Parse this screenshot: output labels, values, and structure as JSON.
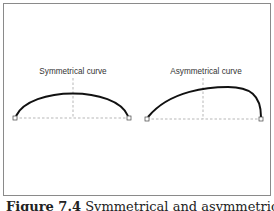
{
  "figure": {
    "caption_number": "Figure 7.4",
    "caption_text": "Symmetrical and asymmetrical curves",
    "panels": [
      {
        "label": "Symmetrical curve",
        "type": "symmetrical",
        "anchor_left": [
          15,
          118
        ],
        "anchor_right": [
          129,
          118
        ],
        "midline_x": 73,
        "peak": [
          73,
          89
        ]
      },
      {
        "label": "Asymmetrical curve",
        "type": "asymmetrical",
        "anchor_left": [
          147,
          119
        ],
        "anchor_right": [
          261,
          119
        ],
        "midline_x": 203,
        "peak": [
          228,
          87
        ]
      }
    ]
  },
  "colors": {
    "curve": "#111111",
    "guide": "#9a9a9a",
    "frame": "#8a8a8a",
    "text": "#333333"
  }
}
